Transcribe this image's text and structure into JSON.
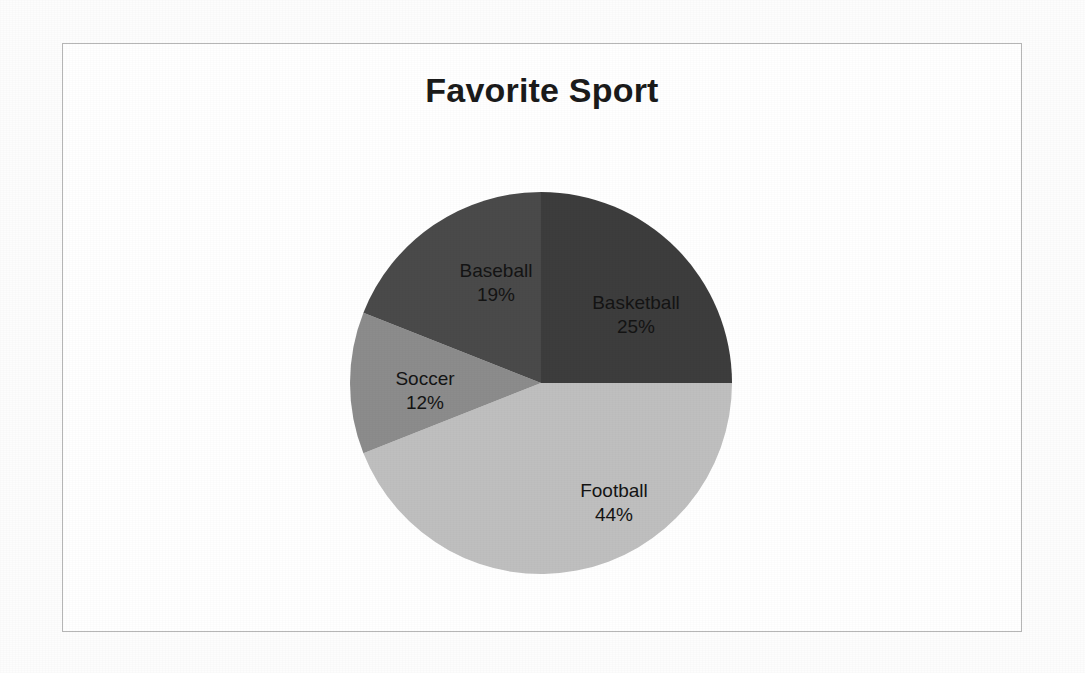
{
  "chart_data": {
    "type": "pie",
    "title": "Favorite Sport",
    "xlabel": "",
    "ylabel": "",
    "legend": "none",
    "grid": false,
    "label_format": "name + percent inside slice",
    "start_angle_deg": 0,
    "direction": "clockwise",
    "categories": [
      "Basketball",
      "Football",
      "Soccer",
      "Baseball"
    ],
    "values": [
      25,
      44,
      12,
      19
    ],
    "unit": "%",
    "colors": [
      "#3d3d3d",
      "#bfbfbf",
      "#8c8c8c",
      "#4a4a4a"
    ],
    "slices": [
      {
        "name": "Basketball",
        "value": 25,
        "value_label": "25%",
        "color": "#3d3d3d"
      },
      {
        "name": "Football",
        "value": 44,
        "value_label": "44%",
        "color": "#bfbfbf"
      },
      {
        "name": "Soccer",
        "value": 12,
        "value_label": "12%",
        "color": "#8c8c8c"
      },
      {
        "name": "Baseball",
        "value": 19,
        "value_label": "19%",
        "color": "#4a4a4a"
      }
    ]
  },
  "chart": {
    "title": "Favorite Sport",
    "border_color": "#b6b6b6",
    "background": "#ffffff"
  },
  "labels": {
    "basketball": {
      "name": "Basketball",
      "value": "25%"
    },
    "football": {
      "name": "Football",
      "value": "44%"
    },
    "soccer": {
      "name": "Soccer",
      "value": "12%"
    },
    "baseball": {
      "name": "Baseball",
      "value": "19%"
    }
  }
}
